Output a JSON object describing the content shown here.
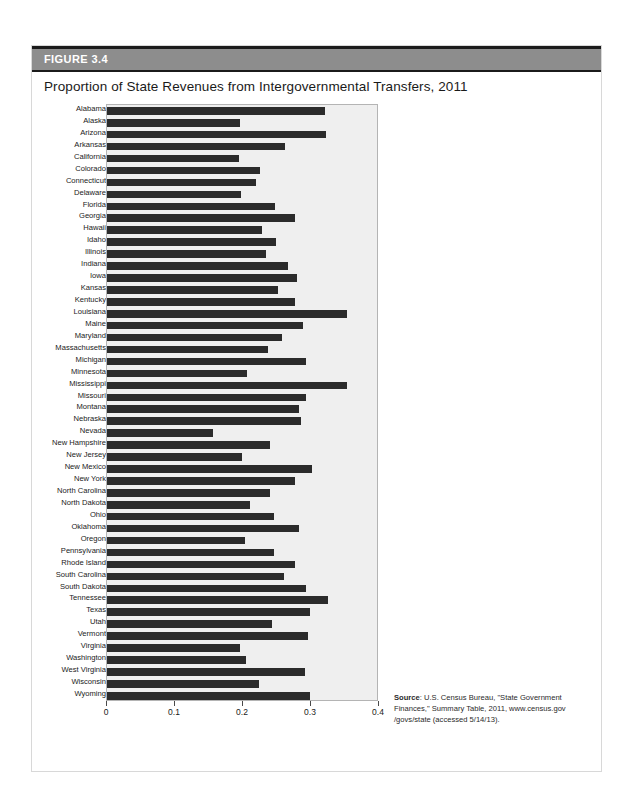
{
  "figure": {
    "label": "FIGURE 3.4",
    "title": "Proportion of State Revenues from Intergovernmental Transfers, 2011",
    "source_prefix": "Source",
    "source_text": ": U.S. Census Bureau, \"State Government Finances,\" Summary Table, 2011, www.census.gov /govs/state (accessed 5/14/13)."
  },
  "colors": {
    "header_band": "#8d8d8d",
    "bar": "#2b2b2b",
    "plot_background": "#efefef",
    "rule": "#1b1b1b"
  },
  "chart_data": {
    "type": "bar",
    "orientation": "horizontal",
    "title": "Proportion of State Revenues from Intergovernmental Transfers, 2011",
    "xlabel": "",
    "ylabel": "",
    "xlim": [
      0,
      0.4
    ],
    "xticks": [
      0,
      0.1,
      0.2,
      0.3,
      0.4
    ],
    "xtick_labels": [
      "0",
      "0.1",
      "0.2",
      "0.3",
      "0.4"
    ],
    "grid": false,
    "legend": null,
    "categories": [
      "Alabama",
      "Alaska",
      "Arizona",
      "Arkansas",
      "California",
      "Colorado",
      "Connecticut",
      "Delaware",
      "Florida",
      "Georgia",
      "Hawaii",
      "Idaho",
      "Illinois",
      "Indiana",
      "Iowa",
      "Kansas",
      "Kentucky",
      "Louisiana",
      "Maine",
      "Maryland",
      "Massachusetts",
      "Michigan",
      "Minnesota",
      "Mississippi",
      "Missouri",
      "Montana",
      "Nebraska",
      "Nevada",
      "New Hampshire",
      "New Jersey",
      "New Mexico",
      "New York",
      "North Carolina",
      "North Dakota",
      "Ohio",
      "Oklahoma",
      "Oregon",
      "Pennsylvania",
      "Rhode Island",
      "South Carolina",
      "South Dakota",
      "Tennessee",
      "Texas",
      "Utah",
      "Vermont",
      "Virginia",
      "Washington",
      "West Virginia",
      "Wisconsin",
      "Wyoming"
    ],
    "values": [
      0.323,
      0.197,
      0.324,
      0.263,
      0.196,
      0.227,
      0.221,
      0.199,
      0.249,
      0.278,
      0.229,
      0.251,
      0.235,
      0.268,
      0.281,
      0.254,
      0.278,
      0.355,
      0.29,
      0.259,
      0.238,
      0.295,
      0.207,
      0.356,
      0.295,
      0.285,
      0.287,
      0.157,
      0.241,
      0.2,
      0.304,
      0.278,
      0.241,
      0.212,
      0.247,
      0.285,
      0.205,
      0.247,
      0.278,
      0.262,
      0.295,
      0.328,
      0.301,
      0.245,
      0.298,
      0.197,
      0.206,
      0.294,
      0.225,
      0.301
    ]
  }
}
